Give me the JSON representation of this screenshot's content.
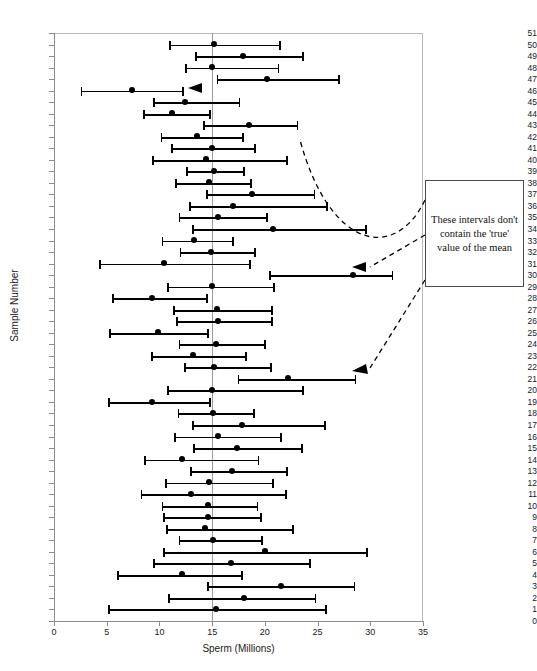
{
  "chart_data": {
    "type": "bar",
    "title": "",
    "xlabel": "Sperm (Millions)",
    "ylabel": "Sample Number",
    "xlim": [
      0,
      35
    ],
    "ylim": [
      0,
      51
    ],
    "xticks": [
      0,
      5,
      10,
      15,
      20,
      25,
      30,
      35
    ],
    "grid": false,
    "reference_line": {
      "value": 15,
      "label": "true mean"
    },
    "annotation": "These intervals don't contain the 'true' value of the mean",
    "annotation_targets": [
      46,
      30,
      21
    ],
    "categories": [
      50,
      49,
      48,
      47,
      46,
      45,
      44,
      43,
      42,
      41,
      40,
      39,
      38,
      37,
      36,
      35,
      34,
      33,
      32,
      31,
      30,
      29,
      28,
      27,
      26,
      25,
      24,
      23,
      22,
      21,
      20,
      19,
      18,
      17,
      16,
      15,
      14,
      13,
      12,
      11,
      10,
      9,
      8,
      7,
      6,
      5,
      4,
      3,
      2,
      1
    ],
    "series": [
      {
        "name": "mean",
        "values": [
          15.2,
          17.9,
          15.0,
          20.2,
          7.4,
          12.4,
          11.2,
          18.5,
          13.6,
          15.0,
          14.4,
          15.2,
          14.7,
          18.8,
          17.0,
          15.6,
          20.8,
          13.3,
          14.9,
          10.4,
          28.4,
          15.0,
          9.3,
          15.5,
          15.6,
          9.9,
          15.4,
          13.2,
          15.2,
          22.2,
          15.0,
          9.3,
          15.1,
          17.8,
          15.6,
          17.4,
          12.1,
          16.9,
          14.7,
          13.0,
          14.6,
          14.6,
          14.3,
          15.1,
          20.0,
          16.8,
          12.1,
          21.5,
          18.0,
          15.4
        ]
      },
      {
        "name": "ci_lower",
        "values": [
          11.0,
          13.5,
          12.5,
          15.5,
          2.6,
          9.5,
          8.5,
          14.2,
          10.2,
          11.2,
          9.4,
          12.6,
          11.6,
          14.5,
          12.9,
          11.9,
          13.2,
          10.3,
          12.0,
          4.4,
          20.5,
          10.8,
          5.6,
          11.4,
          11.7,
          5.3,
          11.9,
          9.3,
          12.4,
          17.5,
          10.8,
          5.2,
          11.8,
          13.2,
          11.5,
          13.3,
          8.6,
          13.0,
          10.6,
          8.3,
          10.3,
          10.4,
          10.7,
          11.9,
          10.4,
          9.5,
          6.1,
          14.6,
          10.9,
          5.2
        ]
      },
      {
        "name": "ci_upper",
        "values": [
          21.4,
          23.6,
          21.3,
          27.0,
          12.2,
          17.6,
          14.8,
          23.1,
          17.9,
          19.1,
          22.1,
          18.0,
          18.7,
          24.7,
          25.9,
          20.2,
          29.6,
          17.0,
          19.1,
          18.6,
          32.1,
          20.9,
          14.5,
          20.7,
          20.7,
          14.6,
          20.0,
          18.2,
          20.6,
          28.6,
          23.6,
          14.8,
          19.0,
          25.7,
          21.5,
          23.5,
          19.4,
          22.1,
          20.8,
          22.0,
          19.3,
          19.6,
          22.7,
          19.7,
          29.7,
          24.3,
          17.8,
          28.5,
          24.8,
          25.8
        ]
      }
    ]
  }
}
